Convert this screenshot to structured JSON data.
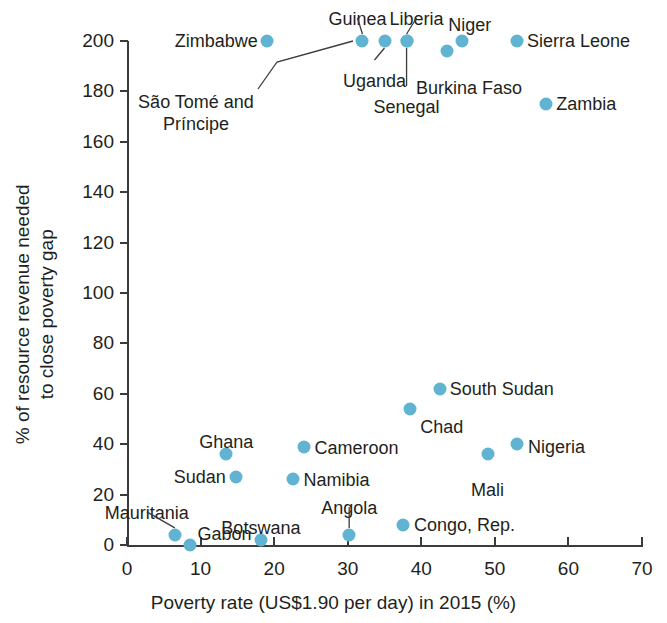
{
  "chart_data": {
    "type": "scatter",
    "title": "",
    "xlabel": "Poverty rate (US$1.90 per day) in 2015 (%)",
    "ylabel": "% of resource revenue needed\nto close poverty gap",
    "ylabel_line1": "% of resource revenue needed",
    "ylabel_line2": "to close poverty gap",
    "xlim": [
      0,
      70
    ],
    "ylim": [
      0,
      200
    ],
    "xticks": [
      0,
      10,
      20,
      30,
      40,
      50,
      60,
      70
    ],
    "yticks": [
      0,
      20,
      40,
      60,
      80,
      100,
      120,
      140,
      160,
      180,
      200
    ],
    "grid": false,
    "legend": "none",
    "marker_color": "#61b4d1",
    "points": [
      {
        "name": "Zimbabwe",
        "x": 19.0,
        "y": 200,
        "label_pos": "left",
        "label_dx": -9,
        "label_dy": 0
      },
      {
        "name": "Guinea",
        "x": 32.0,
        "y": 200,
        "label_pos": "center",
        "label_dx": -5,
        "label_dy": -32,
        "leader": true
      },
      {
        "name": "Uganda",
        "x": 35.0,
        "y": 200,
        "label_pos": "center",
        "label_dx": -10,
        "label_dy": 30,
        "leader": true
      },
      {
        "name": "Liberia",
        "x": 38.0,
        "y": 200,
        "label_pos": "center",
        "label_dx": 10,
        "label_dy": -32,
        "leader": true
      },
      {
        "name": "Senegal",
        "x": 38.0,
        "y": 200,
        "label_pos": "center",
        "label_dx": 0,
        "label_dy": 56,
        "leader": true
      },
      {
        "name": "Burkina Faso",
        "x": 43.5,
        "y": 196,
        "label_pos": "center",
        "label_dx": 22,
        "label_dy": 27
      },
      {
        "name": "Niger",
        "x": 45.5,
        "y": 200,
        "label_pos": "center",
        "label_dx": 8,
        "label_dy": -26
      },
      {
        "name": "Sierra Leone",
        "x": 53.0,
        "y": 200,
        "label_pos": "right",
        "label_dx": 10,
        "label_dy": 0
      },
      {
        "name": "São Tomé and\nPríncipe",
        "x": 32.0,
        "y": 200,
        "label_pos": "center",
        "label_dx": -96,
        "label_dy": 72,
        "leader": false,
        "ghost": true
      },
      {
        "name": "Zambia",
        "x": 57.0,
        "y": 175,
        "label_pos": "right",
        "label_dx": 10,
        "label_dy": 0
      },
      {
        "name": "South Sudan",
        "x": 42.5,
        "y": 62,
        "label_pos": "right",
        "label_dx": 10,
        "label_dy": 0
      },
      {
        "name": "Chad",
        "x": 38.5,
        "y": 54,
        "label_pos": "right",
        "label_dx": 10,
        "label_dy": 18
      },
      {
        "name": "Nigeria",
        "x": 53.0,
        "y": 40,
        "label_pos": "right",
        "label_dx": 11,
        "label_dy": 3
      },
      {
        "name": "Mali",
        "x": 49.0,
        "y": 36,
        "label_pos": "center",
        "label_dx": 0,
        "label_dy": 26
      },
      {
        "name": "Cameroon",
        "x": 24.0,
        "y": 39,
        "label_pos": "right",
        "label_dx": 11,
        "label_dy": 1
      },
      {
        "name": "Ghana",
        "x": 13.5,
        "y": 36,
        "label_pos": "center",
        "label_dx": 0,
        "label_dy": -22
      },
      {
        "name": "Sudan",
        "x": 14.8,
        "y": 27,
        "label_pos": "left",
        "label_dx": -10,
        "label_dy": 0
      },
      {
        "name": "Namibia",
        "x": 22.5,
        "y": 26,
        "label_pos": "right",
        "label_dx": 11,
        "label_dy": 1
      },
      {
        "name": "Mauritania",
        "x": 6.5,
        "y": 4,
        "label_pos": "center",
        "label_dx": -28,
        "label_dy": -32,
        "leader": true
      },
      {
        "name": "Gabon",
        "x": 8.5,
        "y": 0,
        "label_pos": "right",
        "label_dx": 8,
        "label_dy": -11
      },
      {
        "name": "Botswana",
        "x": 18.2,
        "y": 2,
        "label_pos": "center",
        "label_dx": 0,
        "label_dy": -22
      },
      {
        "name": "Angola",
        "x": 30.2,
        "y": 4,
        "label_pos": "center",
        "label_dx": 0,
        "label_dy": -37,
        "leader": true
      },
      {
        "name": "Congo, Rep.",
        "x": 37.5,
        "y": 8,
        "label_pos": "right",
        "label_dx": 11,
        "label_dy": 0
      }
    ],
    "annotations": [
      {
        "text": "São Tomé and",
        "x_px": 196,
        "y_px": 92
      },
      {
        "text": "Príncipe",
        "x_px": 196,
        "y_px": 114
      }
    ]
  }
}
